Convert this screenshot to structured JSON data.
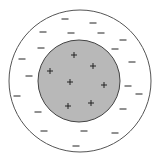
{
  "diagram": {
    "title": "Charge distribution: positive inner sphere surrounded by negative shell",
    "colors": {
      "background": "#ffffff",
      "outer_stroke": "#555555",
      "inner_fill": "#b8b8b8",
      "inner_stroke": "#444444",
      "symbol": "#222222"
    },
    "outer_circle": {
      "cx": 80,
      "cy": 81,
      "r": 71
    },
    "inner_circle": {
      "cx": 79,
      "cy": 81,
      "r": 41
    },
    "positive_charges": [
      {
        "x": 74,
        "y": 55
      },
      {
        "x": 93,
        "y": 66
      },
      {
        "x": 50,
        "y": 71
      },
      {
        "x": 70,
        "y": 82
      },
      {
        "x": 104,
        "y": 85
      },
      {
        "x": 91,
        "y": 103
      },
      {
        "x": 68,
        "y": 106
      }
    ],
    "negative_charges": [
      {
        "x": 65,
        "y": 19
      },
      {
        "x": 93,
        "y": 23
      },
      {
        "x": 43,
        "y": 32
      },
      {
        "x": 71,
        "y": 33
      },
      {
        "x": 101,
        "y": 33
      },
      {
        "x": 123,
        "y": 40
      },
      {
        "x": 41,
        "y": 48
      },
      {
        "x": 115,
        "y": 49
      },
      {
        "x": 22,
        "y": 59
      },
      {
        "x": 132,
        "y": 62
      },
      {
        "x": 29,
        "y": 76
      },
      {
        "x": 128,
        "y": 86
      },
      {
        "x": 17,
        "y": 96
      },
      {
        "x": 139,
        "y": 94
      },
      {
        "x": 38,
        "y": 112
      },
      {
        "x": 123,
        "y": 109
      },
      {
        "x": 44,
        "y": 131
      },
      {
        "x": 84,
        "y": 131
      },
      {
        "x": 115,
        "y": 133
      },
      {
        "x": 76,
        "y": 146
      }
    ],
    "symbols": {
      "positive": "+",
      "negative": "−"
    }
  }
}
